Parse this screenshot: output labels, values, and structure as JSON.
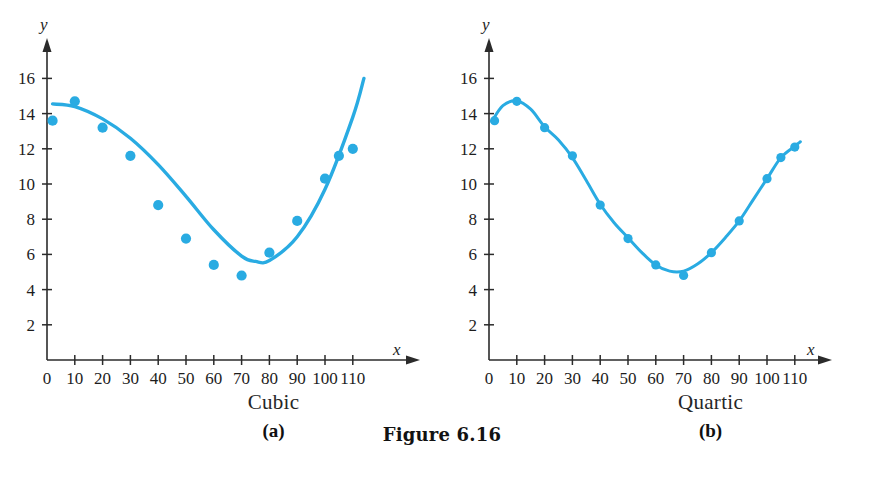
{
  "figure": {
    "label": "Figure 6.16",
    "cropped_header_text": "",
    "accent_color": "#29ABE2",
    "axis_color": "#2b2b2b"
  },
  "panels": [
    {
      "id": "a",
      "name": "Cubic",
      "letter": "(a)",
      "axis": {
        "x_name": "x",
        "y_name": "y"
      }
    },
    {
      "id": "b",
      "name": "Quartic",
      "letter": "(b)",
      "axis": {
        "x_name": "x",
        "y_name": "y"
      }
    }
  ],
  "chart_data": [
    {
      "type": "scatter",
      "title": "Cubic",
      "subtitle": "(a)",
      "xlabel": "x",
      "ylabel": "y",
      "xlim": [
        0,
        118
      ],
      "ylim": [
        0,
        17
      ],
      "xticks": [
        0,
        10,
        20,
        30,
        40,
        50,
        60,
        70,
        80,
        90,
        100,
        110
      ],
      "xticklabels": [
        "0",
        "10",
        "20",
        "30",
        "40",
        "50",
        "60",
        "70",
        "80",
        "90",
        "100",
        "110"
      ],
      "yticks": [
        2,
        4,
        6,
        8,
        10,
        12,
        14,
        16
      ],
      "yticklabels": [
        "2",
        "4",
        "6",
        "8",
        "10",
        "12",
        "14",
        "16"
      ],
      "grid": false,
      "legend": "none",
      "marker_color": "#29ABE2",
      "line_color": "#29ABE2",
      "x": [
        2,
        10,
        20,
        30,
        40,
        50,
        60,
        70,
        80,
        90,
        100,
        105,
        110
      ],
      "y": [
        13.6,
        14.7,
        13.2,
        11.6,
        8.8,
        6.9,
        5.4,
        4.8,
        6.1,
        7.9,
        10.3,
        11.6,
        12.0
      ],
      "fit": {
        "name": "cubic regression",
        "degree": 3,
        "x": [
          2,
          10,
          20,
          30,
          40,
          50,
          60,
          70,
          75,
          80,
          90,
          100,
          110,
          114
        ],
        "y": [
          14.55,
          14.4,
          13.7,
          12.6,
          11.1,
          9.3,
          7.4,
          5.9,
          5.6,
          5.65,
          7.0,
          9.7,
          13.8,
          16.0
        ]
      }
    },
    {
      "type": "scatter",
      "title": "Quartic",
      "subtitle": "(b)",
      "xlabel": "x",
      "ylabel": "y",
      "xlim": [
        0,
        118
      ],
      "ylim": [
        0,
        17
      ],
      "xticks": [
        0,
        10,
        20,
        30,
        40,
        50,
        60,
        70,
        80,
        90,
        100,
        110
      ],
      "xticklabels": [
        "0",
        "10",
        "20",
        "30",
        "40",
        "50",
        "60",
        "70",
        "80",
        "90",
        "100",
        "110"
      ],
      "yticks": [
        2,
        4,
        6,
        8,
        10,
        12,
        14,
        16
      ],
      "yticklabels": [
        "2",
        "4",
        "6",
        "8",
        "10",
        "12",
        "14",
        "16"
      ],
      "grid": false,
      "legend": "none",
      "marker_color": "#29ABE2",
      "line_color": "#29ABE2",
      "x": [
        2,
        10,
        20,
        30,
        40,
        50,
        60,
        70,
        80,
        90,
        100,
        105,
        110
      ],
      "y": [
        13.6,
        14.7,
        13.2,
        11.6,
        8.8,
        6.9,
        5.4,
        4.8,
        6.1,
        7.9,
        10.3,
        11.5,
        12.1
      ],
      "fit": {
        "name": "quartic regression",
        "degree": 4,
        "x": [
          1,
          5,
          10,
          15,
          20,
          25,
          30,
          35,
          40,
          45,
          50,
          55,
          60,
          65,
          70,
          75,
          80,
          85,
          90,
          95,
          100,
          105,
          110,
          112
        ],
        "y": [
          13.55,
          14.45,
          14.72,
          14.25,
          13.25,
          12.5,
          11.5,
          10.2,
          8.85,
          7.8,
          6.95,
          6.1,
          5.4,
          5.05,
          5.05,
          5.45,
          6.1,
          6.95,
          7.9,
          9.1,
          10.3,
          11.5,
          12.15,
          12.4
        ]
      }
    }
  ]
}
